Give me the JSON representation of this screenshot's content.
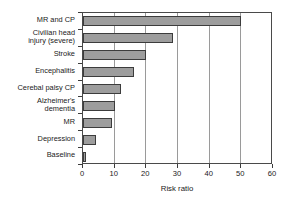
{
  "chart_data": {
    "type": "bar",
    "orientation": "horizontal",
    "title": "",
    "xlabel": "Risk ratio",
    "ylabel": "",
    "xlim": [
      0,
      60
    ],
    "xticks": [
      0,
      10,
      20,
      30,
      40,
      50,
      60
    ],
    "xtick_labels": [
      "0",
      "10",
      "20",
      "30",
      "40",
      "50",
      "60"
    ],
    "grid": "vertical",
    "legend": "none",
    "bar_color": "#9d9d9d",
    "bar_edge_color": "#3c3c3c",
    "axis_color": "#4a4a4a",
    "gridline_color": "#9a9a9a",
    "categories": [
      "MR and CP",
      "Civilian head\ninjury (severe)",
      "Stroke",
      "Encephalitis",
      "Cerebal palsy CP",
      "Alzheimer's\ndementia",
      "MR",
      "Depression",
      "Baseline"
    ],
    "values": [
      50,
      28.5,
      20,
      16,
      12,
      10,
      9,
      4,
      1
    ]
  }
}
